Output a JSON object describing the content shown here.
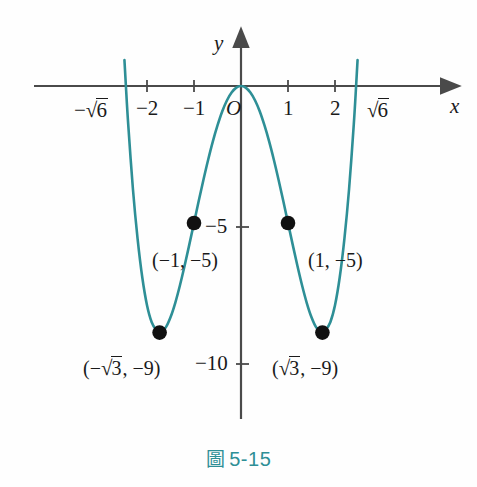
{
  "figure": {
    "caption_mark": "圖",
    "caption_number": "5-15",
    "accent_color": "#2e8f96",
    "axis_color": "#4a4a4a",
    "point_color": "#111111"
  },
  "axes": {
    "x_axis_name": "x",
    "y_axis_name": "y",
    "origin_label": "O",
    "x_ticks": [
      {
        "value": -2,
        "label": "−2"
      },
      {
        "value": -1,
        "label": "−1"
      },
      {
        "value": 1,
        "label": "1"
      },
      {
        "value": 2,
        "label": "2"
      }
    ],
    "x_special_ticks": [
      {
        "value": -2.449,
        "sign": "−",
        "radical": "√",
        "radicand": "6"
      },
      {
        "value": 2.449,
        "sign": "",
        "radical": "√",
        "radicand": "6"
      }
    ],
    "y_ticks": [
      {
        "value": -5,
        "label": "−5"
      },
      {
        "value": -10,
        "label": "−10"
      }
    ]
  },
  "points": [
    {
      "id": "left-min",
      "x": -1.732,
      "y": -9,
      "label_open": "(−",
      "label_radical": "√",
      "label_radicand": "3",
      "label_rest": ", −9)"
    },
    {
      "id": "right-min",
      "x": 1.732,
      "y": -9,
      "label_open": "(",
      "label_radical": "√",
      "label_radicand": "3",
      "label_rest": ", −9)"
    },
    {
      "id": "left-5",
      "x": -1,
      "y": -5,
      "label": "(−1, −5)"
    },
    {
      "id": "right-5",
      "x": 1,
      "y": -5,
      "label": "(1, −5)"
    }
  ],
  "chart_data": {
    "type": "line",
    "title": "",
    "subtitle": "",
    "xlabel": "x",
    "ylabel": "y",
    "function": "y = x^4 - 6x^2",
    "xlim": [
      -2.75,
      2.75
    ],
    "ylim": [
      -11.5,
      1.5
    ],
    "grid": false,
    "legend": null,
    "x_tick_values": [
      -2.449,
      -2,
      -1,
      0,
      1,
      2,
      2.449
    ],
    "x_tick_labels": [
      "−√6",
      "−2",
      "−1",
      "O",
      "1",
      "2",
      "√6"
    ],
    "y_tick_values": [
      -5,
      -10
    ],
    "y_tick_labels": [
      "−5",
      "−10"
    ],
    "series": [
      {
        "name": "y = x^4 - 6x^2",
        "color": "#2e8f96",
        "x": [
          -2.6,
          -2.5,
          -2.449,
          -2.4,
          -2.3,
          -2.2,
          -2.1,
          -2.0,
          -1.9,
          -1.8,
          -1.732,
          -1.7,
          -1.6,
          -1.5,
          -1.4,
          -1.3,
          -1.2,
          -1.1,
          -1.0,
          -0.9,
          -0.8,
          -0.7,
          -0.6,
          -0.5,
          -0.4,
          -0.3,
          -0.2,
          -0.1,
          0.0,
          0.1,
          0.2,
          0.3,
          0.4,
          0.5,
          0.6,
          0.7,
          0.8,
          0.9,
          1.0,
          1.1,
          1.2,
          1.3,
          1.4,
          1.5,
          1.6,
          1.7,
          1.732,
          1.8,
          1.9,
          2.0,
          2.1,
          2.2,
          2.3,
          2.4,
          2.449,
          2.5,
          2.6
        ],
        "y": [
          5.12,
          1.56,
          0.0,
          -1.39,
          -3.75,
          -5.58,
          -6.99,
          -8.0,
          -8.62,
          -8.91,
          -9.0,
          -8.98,
          -8.81,
          -8.44,
          -7.92,
          -7.28,
          -6.56,
          -5.79,
          -5.0,
          -4.2,
          -3.43,
          -2.7,
          -2.03,
          -1.44,
          -0.93,
          -0.53,
          -0.24,
          -0.06,
          0.0,
          -0.06,
          -0.24,
          -0.53,
          -0.93,
          -1.44,
          -2.03,
          -2.7,
          -3.43,
          -4.2,
          -5.0,
          -5.79,
          -6.56,
          -7.28,
          -7.92,
          -8.44,
          -8.81,
          -8.98,
          -9.0,
          -8.91,
          -8.62,
          -8.0,
          -6.99,
          -5.58,
          -3.75,
          -1.39,
          0.0,
          1.56,
          5.12
        ]
      }
    ],
    "marked_points": [
      {
        "x": -1.732,
        "y": -9,
        "label": "(−√3, −9)"
      },
      {
        "x": -1,
        "y": -5,
        "label": "(−1, −5)"
      },
      {
        "x": 1,
        "y": -5,
        "label": "(1, −5)"
      },
      {
        "x": 1.732,
        "y": -9,
        "label": "(√3, −9)"
      }
    ],
    "roots": [
      -2.449,
      0,
      2.449
    ],
    "annotations": [
      "圖 5-15"
    ]
  }
}
